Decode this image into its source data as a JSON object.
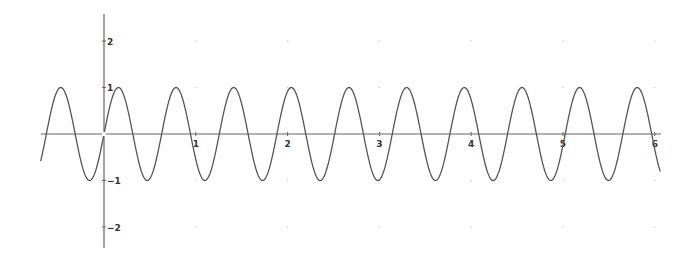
{
  "chart_data": {
    "type": "line",
    "title": "",
    "xlabel": "",
    "ylabel": "",
    "function": "y = sin(10x)",
    "xlim": [
      -0.69,
      6.06
    ],
    "ylim": [
      -2.5,
      2.6
    ],
    "x_ticks": [
      1,
      2,
      3,
      4,
      5,
      6
    ],
    "x_tick_labels": [
      "1",
      "2",
      "3",
      "4",
      "5",
      "6"
    ],
    "y_ticks": [
      2,
      1,
      -1,
      -2
    ],
    "y_tick_labels": [
      "2",
      "1",
      "−1",
      "−2"
    ],
    "grid": "dots at integer x, y=±1, ±2",
    "legend": null,
    "series": [
      {
        "name": "sin(10x)",
        "amplitude": 1,
        "period": 0.628,
        "x_start": -0.69,
        "x_end": 6.06,
        "peaks_x": [
          -0.471,
          0.157,
          0.785,
          1.414,
          2.042,
          2.67,
          3.299,
          3.927,
          4.555,
          5.184,
          5.812
        ],
        "troughs_x": [
          -0.157,
          0.471,
          1.1,
          1.728,
          2.356,
          2.985,
          3.613,
          4.241,
          4.869,
          5.498
        ]
      }
    ]
  },
  "style": {
    "curve_color": "#555555",
    "axis_color": "#666666",
    "label_color": "#333333",
    "grid_dot_color": "#cccccc"
  },
  "layout": {
    "origin_px": [
      104,
      134
    ],
    "px_per_unit_x": 91.8,
    "px_per_unit_y": 46.5,
    "x_axis_px": [
      41,
      661
    ],
    "y_axis_px": [
      14,
      248
    ]
  }
}
